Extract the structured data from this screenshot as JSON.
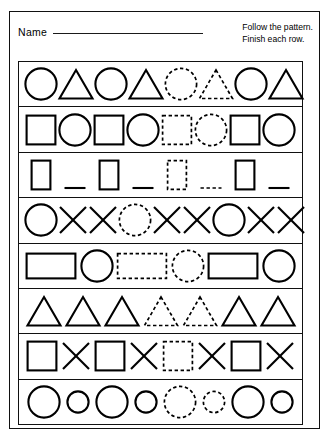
{
  "worksheet": {
    "name_label": "Name",
    "instruction_line_1": "Follow the pattern.",
    "instruction_line_2": "Finish each row.",
    "ink_color": "#000000",
    "paper_color": "#ffffff"
  },
  "legend": {
    "solid_meaning": "printed shape",
    "dashed_meaning": "shape to trace"
  },
  "rows": [
    {
      "id": "row-1",
      "pattern": "circle, triangle repeating",
      "items": [
        {
          "shape": "circle",
          "style": "solid"
        },
        {
          "shape": "triangle",
          "style": "solid"
        },
        {
          "shape": "circle",
          "style": "solid"
        },
        {
          "shape": "triangle",
          "style": "solid"
        },
        {
          "shape": "circle",
          "style": "dashed"
        },
        {
          "shape": "triangle",
          "style": "dashed"
        },
        {
          "shape": "circle",
          "style": "solid"
        },
        {
          "shape": "triangle",
          "style": "solid"
        }
      ]
    },
    {
      "id": "row-2",
      "pattern": "square, circle repeating",
      "items": [
        {
          "shape": "square",
          "style": "solid"
        },
        {
          "shape": "circle",
          "style": "solid"
        },
        {
          "shape": "square",
          "style": "solid"
        },
        {
          "shape": "circle",
          "style": "solid"
        },
        {
          "shape": "square",
          "style": "dashed"
        },
        {
          "shape": "circle",
          "style": "dashed"
        },
        {
          "shape": "square",
          "style": "solid"
        },
        {
          "shape": "circle",
          "style": "solid"
        }
      ]
    },
    {
      "id": "row-3",
      "pattern": "tall rectangle, dash repeating",
      "items": [
        {
          "shape": "tall-rectangle",
          "style": "solid"
        },
        {
          "shape": "dash",
          "style": "solid"
        },
        {
          "shape": "tall-rectangle",
          "style": "solid"
        },
        {
          "shape": "dash",
          "style": "solid"
        },
        {
          "shape": "tall-rectangle",
          "style": "dashed"
        },
        {
          "shape": "dash",
          "style": "dashed"
        },
        {
          "shape": "tall-rectangle",
          "style": "solid"
        },
        {
          "shape": "dash",
          "style": "solid"
        }
      ]
    },
    {
      "id": "row-4",
      "pattern": "circle, x, x repeating",
      "items": [
        {
          "shape": "circle",
          "style": "solid"
        },
        {
          "shape": "x",
          "style": "solid"
        },
        {
          "shape": "x",
          "style": "solid"
        },
        {
          "shape": "circle",
          "style": "dashed"
        },
        {
          "shape": "x",
          "style": "solid"
        },
        {
          "shape": "x",
          "style": "solid"
        },
        {
          "shape": "circle",
          "style": "solid"
        },
        {
          "shape": "x",
          "style": "solid"
        },
        {
          "shape": "x",
          "style": "solid"
        }
      ]
    },
    {
      "id": "row-5",
      "pattern": "wide rectangle, circle repeating",
      "items": [
        {
          "shape": "wide-rectangle",
          "style": "solid"
        },
        {
          "shape": "circle",
          "style": "solid"
        },
        {
          "shape": "wide-rectangle",
          "style": "dashed"
        },
        {
          "shape": "circle",
          "style": "dashed"
        },
        {
          "shape": "wide-rectangle",
          "style": "solid"
        },
        {
          "shape": "circle",
          "style": "solid"
        }
      ]
    },
    {
      "id": "row-6",
      "pattern": "triangle repeating",
      "items": [
        {
          "shape": "triangle",
          "style": "solid"
        },
        {
          "shape": "triangle",
          "style": "solid"
        },
        {
          "shape": "triangle",
          "style": "solid"
        },
        {
          "shape": "triangle",
          "style": "dashed"
        },
        {
          "shape": "triangle",
          "style": "dashed"
        },
        {
          "shape": "triangle",
          "style": "solid"
        },
        {
          "shape": "triangle",
          "style": "solid"
        }
      ]
    },
    {
      "id": "row-7",
      "pattern": "square, x repeating",
      "items": [
        {
          "shape": "square",
          "style": "solid"
        },
        {
          "shape": "x",
          "style": "solid"
        },
        {
          "shape": "square",
          "style": "solid"
        },
        {
          "shape": "x",
          "style": "solid"
        },
        {
          "shape": "square",
          "style": "dashed"
        },
        {
          "shape": "x",
          "style": "solid"
        },
        {
          "shape": "square",
          "style": "solid"
        },
        {
          "shape": "x",
          "style": "solid"
        }
      ]
    },
    {
      "id": "row-8",
      "pattern": "big circle, small circle repeating",
      "items": [
        {
          "shape": "circle-big",
          "style": "solid"
        },
        {
          "shape": "circle-small",
          "style": "solid"
        },
        {
          "shape": "circle-big",
          "style": "solid"
        },
        {
          "shape": "circle-small",
          "style": "solid"
        },
        {
          "shape": "circle-big",
          "style": "dashed"
        },
        {
          "shape": "circle-small",
          "style": "dashed"
        },
        {
          "shape": "circle-big",
          "style": "solid"
        },
        {
          "shape": "circle-small",
          "style": "solid"
        }
      ]
    }
  ]
}
